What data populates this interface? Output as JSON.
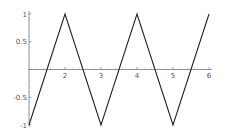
{
  "chart_data": {
    "type": "line",
    "title": "",
    "xlabel": "",
    "ylabel": "",
    "x": [
      1,
      2,
      3,
      4,
      5,
      6
    ],
    "series": [
      {
        "name": "triangle wave",
        "values": [
          -1,
          1,
          -1,
          1,
          -1,
          1
        ],
        "color": "#222222"
      }
    ],
    "xlim": [
      1,
      6
    ],
    "ylim": [
      -1,
      1
    ],
    "x_ticks": [
      2,
      3,
      4,
      5,
      6
    ],
    "x_tick_labels": [
      "2",
      "3",
      "4",
      "5",
      "6"
    ],
    "y_ticks": [
      1,
      0.5,
      -0.5,
      -1
    ],
    "y_tick_labels": [
      "1",
      "0.5",
      "-0.5",
      "-1"
    ],
    "grid": false,
    "legend": null,
    "axis_origin": {
      "x": 1,
      "y": 0
    }
  }
}
